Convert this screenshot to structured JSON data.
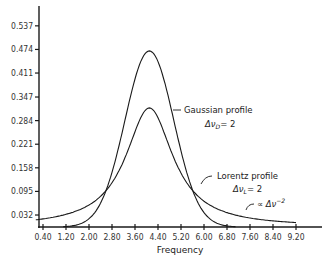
{
  "chart_data": {
    "type": "line",
    "title": "",
    "xlabel": "Frequency",
    "ylabel": "",
    "x_ticks": [
      "0.40",
      "1.20",
      "2.00",
      "2.80",
      "3.60",
      "4.40",
      "5.20",
      "6.00",
      "6.80",
      "7.60",
      "8.40",
      "9.20"
    ],
    "y_ticks": [
      "0.032",
      "0.095",
      "0.158",
      "0.221",
      "0.284",
      "0.347",
      "0.411",
      "0.474",
      "0.537"
    ],
    "xlim": [
      0.15,
      10.2
    ],
    "ylim": [
      0,
      0.59
    ],
    "grid": false,
    "legend": "annotations",
    "series": [
      {
        "name": "Gaussian profile",
        "kind": "gaussian",
        "center": 4.1,
        "fwhm": 2,
        "peak": 0.47,
        "x": [
          0.4,
          1.2,
          2.0,
          2.8,
          3.6,
          4.1,
          4.4,
          5.2,
          6.0,
          6.8
        ],
        "values": [
          0.0,
          0.004,
          0.041,
          0.186,
          0.394,
          0.47,
          0.444,
          0.2,
          0.038,
          0.001
        ]
      },
      {
        "name": "Lorentz profile",
        "kind": "lorentz",
        "center": 4.1,
        "fwhm": 2,
        "peak": 0.318,
        "x": [
          0.4,
          1.2,
          2.0,
          2.8,
          3.6,
          4.1,
          4.4,
          5.2,
          6.0,
          6.8,
          7.6,
          8.4,
          9.2
        ],
        "values": [
          0.021,
          0.033,
          0.058,
          0.118,
          0.254,
          0.318,
          0.291,
          0.144,
          0.069,
          0.038,
          0.024,
          0.016,
          0.012
        ]
      }
    ],
    "annotations": [
      {
        "id": "gauss",
        "line1": "Gaussian profile",
        "line2_prefix": "Δν",
        "line2_sub": "D",
        "line2_suffix": "= 2"
      },
      {
        "id": "lorentz",
        "line1": "Lorentz profile",
        "line2_prefix": "Δν",
        "line2_sub": "L",
        "line2_suffix": "= 2"
      },
      {
        "id": "tail",
        "prefix": "∝ Δν",
        "sup": "−2"
      }
    ]
  }
}
